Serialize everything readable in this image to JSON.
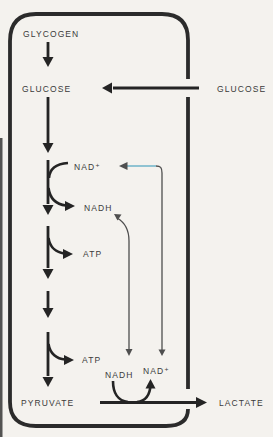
{
  "diagram": {
    "labels": {
      "glycogen": "GLYCOGEN",
      "glucose_inside": "GLUCOSE",
      "glucose_outside": "GLUCOSE",
      "nad_plus_top": "NAD⁺",
      "nadh_top": "NADH",
      "atp_first": "ATP",
      "atp_second": "ATP",
      "nadh_bottom": "NADH",
      "nad_plus_bottom": "NAD⁺",
      "pyruvate": "PYRUVATE",
      "lactate": "LACTATE"
    },
    "colors": {
      "background": "#f4f2ee",
      "ink": "#242424",
      "membrane": "#2b2b2b",
      "thin_line": "#4f4f4f",
      "recycle_blue": "#8fc3d2",
      "label_text": "#3a3a3a"
    }
  }
}
